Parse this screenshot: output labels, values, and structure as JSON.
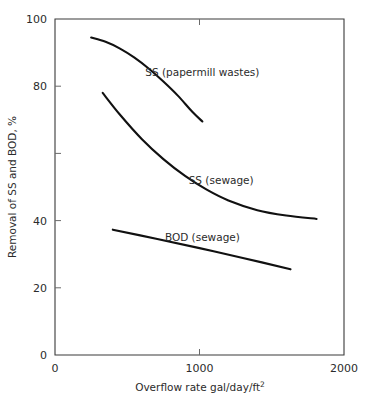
{
  "chart_data": {
    "type": "line",
    "title": "",
    "xlabel": "Overflow rate gal/day/ft2",
    "xlabel_base": "Overflow rate gal/day/ft",
    "xlabel_sup": "2",
    "ylabel": "Removal of SS and BOD, %",
    "xlim": [
      0,
      2000
    ],
    "ylim": [
      0,
      100
    ],
    "xticks": [
      0,
      1000,
      2000
    ],
    "xtick_labels": [
      "0",
      "1000",
      "2000"
    ],
    "yticks": [
      0,
      20,
      40,
      60,
      80,
      100
    ],
    "ytick_labels": [
      "0",
      "20",
      "40",
      "",
      "80",
      "100"
    ],
    "grid": false,
    "legend_position": "inline-annotations",
    "series": [
      {
        "name": "SS (papermill wastes)",
        "label": "SS (papermill wastes)",
        "label_x": 1020,
        "label_y": 83,
        "x": [
          250,
          350,
          450,
          550,
          650,
          750,
          850,
          950,
          1020
        ],
        "y": [
          94.5,
          93.2,
          91.2,
          88.5,
          85.2,
          81.4,
          77.2,
          72.4,
          69.5
        ]
      },
      {
        "name": "SS (sewage)",
        "label": "SS (sewage)",
        "label_x": 1150,
        "label_y": 51,
        "x": [
          330,
          450,
          600,
          750,
          900,
          1050,
          1200,
          1400,
          1600,
          1810
        ],
        "y": [
          78.0,
          71.5,
          64.3,
          58.3,
          53.3,
          49.2,
          46.0,
          43.1,
          41.5,
          40.5
        ]
      },
      {
        "name": "BOD (sewage)",
        "label": "BOD (sewage)",
        "label_x": 1020,
        "label_y": 34,
        "x": [
          400,
          700,
          1000,
          1300,
          1630
        ],
        "y": [
          37.3,
          34.6,
          31.8,
          28.9,
          25.5
        ]
      }
    ]
  },
  "colors": {
    "curve": "#111111",
    "axis": "#3a3a3a",
    "text": "#2b2b2b",
    "background": "#ffffff"
  }
}
